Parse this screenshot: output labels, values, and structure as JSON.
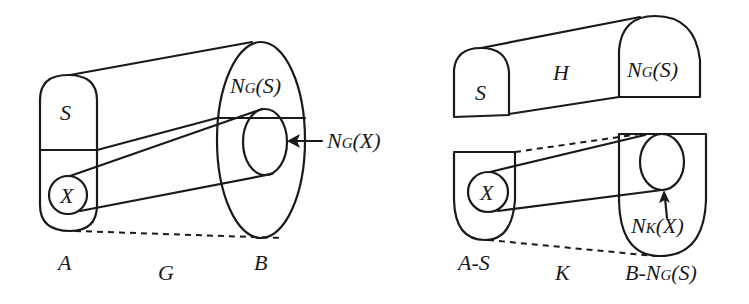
{
  "figure_left": {
    "graph_label": "G",
    "part_a_label": "A",
    "part_b_label": "B",
    "set_s_label": "S",
    "set_x_label": "X",
    "neighborhood_s": {
      "main": "N",
      "sub": "G",
      "arg": "(S)"
    },
    "neighborhood_x": {
      "main": "N",
      "sub": "G",
      "arg": "(X)"
    }
  },
  "figure_right": {
    "graph_h_label": "H",
    "graph_k_label": "K",
    "set_s_label": "S",
    "neighborhood_s": {
      "main": "N",
      "sub": "G",
      "arg": "(S)"
    },
    "set_x_label": "X",
    "part_a_minus_s": "A-S",
    "part_b_minus_ns": {
      "prefix": "B-N",
      "sub": "G",
      "arg": "(S)"
    },
    "neighborhood_k_x": {
      "main": "N",
      "sub": "K",
      "arg": "(X)"
    }
  },
  "colors": {
    "ink": "#1a1a1a",
    "background": "#ffffff"
  }
}
